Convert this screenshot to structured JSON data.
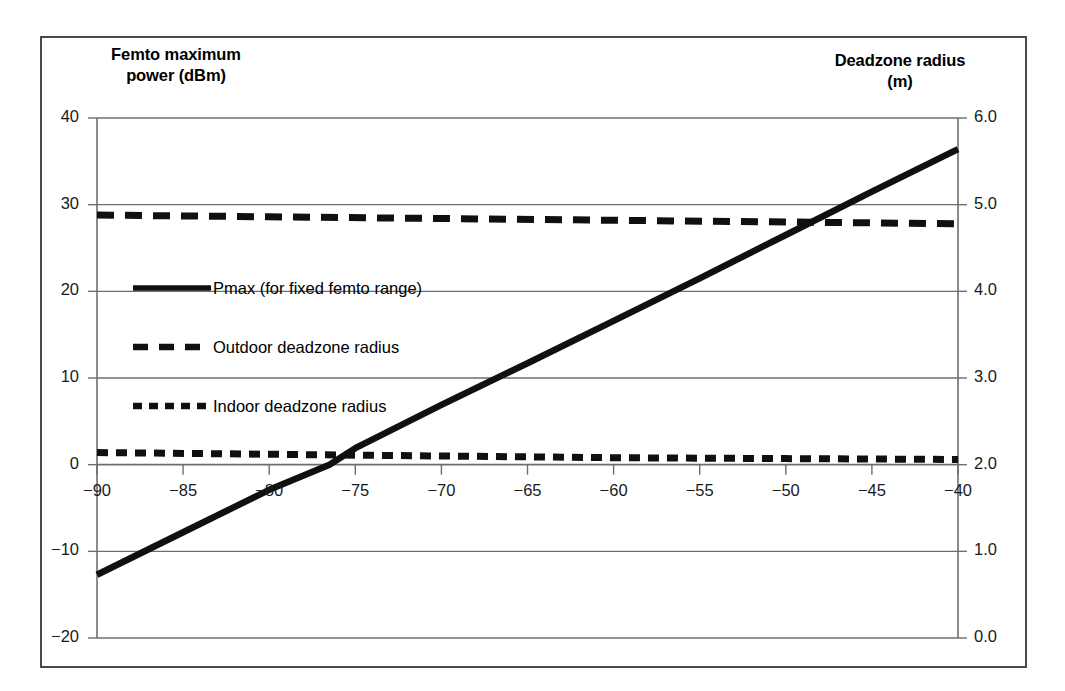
{
  "chart_data": {
    "type": "line",
    "title": "",
    "xlabel": "",
    "ylabel": "Femto maximum power (dBm)",
    "y2label": "Deadzone radius (m)",
    "xlim": [
      -90,
      -40
    ],
    "ylim": [
      -20,
      40
    ],
    "y2lim": [
      0.0,
      6.0
    ],
    "grid": true,
    "legend_position": "inside-upper-left",
    "xticks": [
      "−90",
      "−85",
      "−80",
      "−75",
      "−70",
      "−65",
      "−60",
      "−55",
      "−50",
      "−45",
      "−40"
    ],
    "xtick_values": [
      -90,
      -85,
      -80,
      -75,
      -70,
      -65,
      -60,
      -55,
      -50,
      -45,
      -40
    ],
    "yticks_left": [
      "40",
      "30",
      "20",
      "10",
      "0",
      "−10",
      "−20"
    ],
    "ytick_left_values": [
      40,
      30,
      20,
      10,
      0,
      -10,
      -20
    ],
    "yticks_right": [
      "6.0",
      "5.0",
      "4.0",
      "3.0",
      "2.0",
      "1.0",
      "0.0"
    ],
    "ytick_right_values": [
      6.0,
      5.0,
      4.0,
      3.0,
      2.0,
      1.0,
      0.0
    ],
    "series": [
      {
        "name": "Pmax (for fixed femto range)",
        "axis": "left",
        "style": "solid",
        "color": "#101010",
        "x": [
          -90,
          -85,
          -80,
          -76.5,
          -75,
          -70,
          -65,
          -60,
          -55,
          -50,
          -45,
          -40
        ],
        "values": [
          -12.7,
          -7.8,
          -2.9,
          0.0,
          1.9,
          6.9,
          11.7,
          16.6,
          21.5,
          26.5,
          31.5,
          36.4
        ]
      },
      {
        "name": "Outdoor deadzone radius",
        "axis": "right",
        "style": "dashed-long",
        "color": "#101010",
        "x": [
          -90,
          -80,
          -70,
          -60,
          -50,
          -40
        ],
        "values": [
          4.88,
          4.86,
          4.84,
          4.82,
          4.8,
          4.78
        ]
      },
      {
        "name": "Indoor deadzone radius",
        "axis": "right",
        "style": "dashed-short",
        "color": "#101010",
        "x": [
          -90,
          -80,
          -70,
          -60,
          -50,
          -40
        ],
        "values": [
          2.14,
          2.12,
          2.1,
          2.08,
          2.07,
          2.06
        ]
      }
    ]
  },
  "axes": {
    "left_title_line1": "Femto maximum",
    "left_title_line2": "power (dBm)",
    "right_title_line1": "Deadzone radius",
    "right_title_line2": "(m)"
  },
  "legend": {
    "items": [
      {
        "label": "Pmax (for fixed femto range)",
        "style": "solid"
      },
      {
        "label": "Outdoor deadzone radius",
        "style": "dashed-long"
      },
      {
        "label": "Indoor deadzone radius",
        "style": "dashed-short"
      }
    ]
  }
}
